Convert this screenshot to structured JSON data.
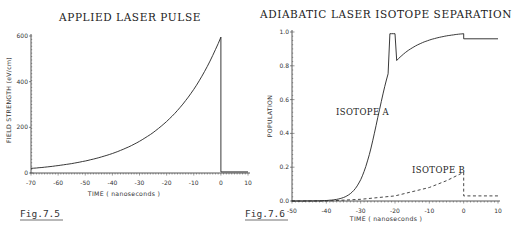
{
  "chart_data": [
    {
      "type": "line",
      "title": "APPLIED LASER PULSE",
      "xlabel": "TIME ( nanoseconds )",
      "ylabel": "FIELD STRENGTH (eV/cm)",
      "xlim": [
        -70,
        10
      ],
      "ylim": [
        0,
        600
      ],
      "xticks": [
        -70,
        -60,
        -50,
        -40,
        -30,
        -20,
        -10,
        0,
        10
      ],
      "yticks": [
        0,
        200,
        400,
        600
      ],
      "grid": false,
      "figure_label": "Fig.7.5",
      "series": [
        {
          "name": "pulse",
          "style": "solid",
          "x": [
            -70,
            -60,
            -50,
            -40,
            -30,
            -20,
            -10,
            -5,
            0,
            0,
            10
          ],
          "y": [
            20,
            33,
            52,
            85,
            140,
            230,
            380,
            480,
            595,
            5,
            5
          ]
        }
      ]
    },
    {
      "type": "line",
      "title": "ADIABATIC LASER ISOTOPE SEPARATION",
      "xlabel": "TIME ( nanoseconds )",
      "ylabel": "POPULATION",
      "xlim": [
        -50,
        10
      ],
      "ylim": [
        0,
        1.0
      ],
      "xticks": [
        -50,
        -40,
        -30,
        -20,
        -10,
        0,
        10
      ],
      "yticks": [
        0.0,
        0.2,
        0.4,
        0.6,
        0.8,
        1.0
      ],
      "grid": false,
      "figure_label": "Fig.7.6",
      "series": [
        {
          "name": "ISOTOPE A",
          "style": "solid",
          "x": [
            -50,
            -40,
            -35,
            -30,
            -27,
            -25,
            -23,
            -20,
            -15,
            -10,
            -5,
            0,
            0,
            10
          ],
          "y": [
            0.0,
            0.01,
            0.03,
            0.1,
            0.25,
            0.45,
            0.68,
            0.82,
            0.9,
            0.94,
            0.97,
            0.99,
            0.96,
            0.96
          ]
        },
        {
          "name": "ISOTOPE B",
          "style": "dashed",
          "x": [
            -50,
            -40,
            -30,
            -20,
            -10,
            -5,
            0,
            0,
            10
          ],
          "y": [
            0.0,
            0.0,
            0.01,
            0.03,
            0.08,
            0.12,
            0.17,
            0.03,
            0.03
          ]
        }
      ],
      "annotations": [
        "ISOTOPE A",
        "ISOTOPE B"
      ]
    }
  ]
}
